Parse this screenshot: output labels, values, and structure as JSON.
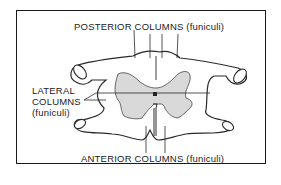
{
  "diagram": {
    "labels": {
      "posterior": "POSTERIOR COLUMNS (funiculi)",
      "lateral_line1": "LATERAL",
      "lateral_line2": "COLUMNS",
      "lateral_line3": "(funiculi)",
      "anterior": "ANTERIOR COLUMNS (funiculi)"
    },
    "colors": {
      "outline": "#2a2a2a",
      "gray_matter": "#d9d9d9",
      "background": "#ffffff"
    }
  }
}
